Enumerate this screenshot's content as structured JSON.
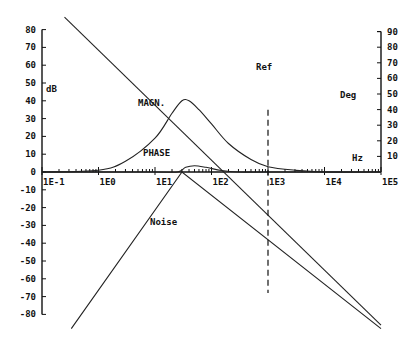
{
  "chart_data": {
    "type": "line",
    "title": "",
    "xlabel": "Hz",
    "ylabel_left": "dB",
    "ylabel_right": "Deg",
    "x_scale": "log",
    "xlim": [
      0.1,
      100000
    ],
    "ylim_left": [
      -80,
      80
    ],
    "ylim_right": [
      0,
      90
    ],
    "x_tick_labels": [
      "1E-1",
      "1E0",
      "1E1",
      "1E2",
      "1E3",
      "1E4",
      "1E5"
    ],
    "y_left_ticks": [
      80,
      70,
      60,
      50,
      40,
      30,
      20,
      10,
      0,
      -10,
      -20,
      -30,
      -40,
      -50,
      -60,
      -70,
      -80
    ],
    "y_right_ticks": [
      90,
      80,
      70,
      60,
      50,
      40,
      30,
      20,
      10
    ],
    "grid": false,
    "series": [
      {
        "name": "MAGN.",
        "axis": "left",
        "x": [
          0.1,
          1,
          3,
          10,
          20,
          30,
          40,
          60,
          100,
          200,
          500,
          1000,
          3000,
          10000,
          100000
        ],
        "values": [
          0,
          1,
          6,
          19,
          33,
          40,
          40,
          35,
          27,
          16,
          7,
          3,
          1,
          0,
          0
        ]
      },
      {
        "name": "PHASE",
        "axis": "right",
        "x": [
          0.1,
          10,
          25,
          35,
          50,
          80,
          150,
          300,
          1000,
          100000
        ],
        "values": [
          0,
          0,
          0,
          3,
          4,
          3,
          1,
          0,
          0,
          0
        ]
      },
      {
        "name": "Noise",
        "axis": "left",
        "x": [
          0.33,
          30,
          100000
        ],
        "values": [
          -88,
          0,
          -88
        ],
        "note": "V-shaped noise envelope peaking near 30 Hz at 0 dB"
      },
      {
        "name": "Falling line",
        "axis": "left",
        "x": [
          0.25,
          100000
        ],
        "values": [
          87,
          -86
        ]
      }
    ],
    "annotations": [
      {
        "text": "Ref",
        "type": "vertical-dashed-line",
        "x": 1000,
        "y_range": [
          -68,
          35
        ]
      },
      {
        "text": "MAGN.",
        "near_x": 10,
        "near_y": 38
      },
      {
        "text": "PHASE",
        "near_x": 12,
        "near_y": 8
      },
      {
        "text": "Noise",
        "near_x": 8,
        "near_y": -37
      },
      {
        "text": "Hz",
        "near_x": 30000,
        "near_y": 7
      }
    ]
  },
  "labels": {
    "db": "dB",
    "deg": "Deg",
    "hz": "Hz",
    "ref": "Ref",
    "magn": "MAGN.",
    "phase": "PHASE",
    "noise": "Noise"
  }
}
